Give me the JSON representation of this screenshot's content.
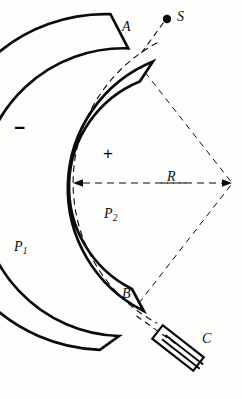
{
  "figure": {
    "background_color": "#fdfdfc",
    "ink_color": "#0b0b0b",
    "viewbox": "0 0 242 399",
    "center_of_curvature": {
      "x": 232,
      "y": 183
    },
    "deflection_angle_deg": 110
  },
  "labels": {
    "source": "S",
    "entrance_aperture": "A",
    "exit_aperture": "B",
    "detector": "C",
    "radius": "R",
    "outer_plate": "P",
    "outer_plate_subscript": "1",
    "inner_plate": "P",
    "inner_plate_subscript": "2",
    "outer_plate_polarity": "−",
    "inner_plate_polarity": "+"
  },
  "geometry": {
    "outer_plate_inner_radius": 137,
    "outer_plate_outer_radius": 160,
    "inner_plate_inner_radius": 114,
    "inner_plate_outer_radius": 137,
    "central_trajectory_radius": 159,
    "plate_start_angle_deg": 125,
    "plate_end_angle_deg": 235,
    "central_arc_start_angle_deg": 118,
    "central_arc_end_angle_deg": 242
  },
  "elements": {
    "source_dot": {
      "x": 167,
      "y": 19,
      "r": 4
    },
    "detector_slit": {
      "x": 178,
      "y": 348,
      "length": 52,
      "width": 15,
      "angle_deg": 38,
      "internal_lines": 2
    },
    "radius_arrow": {
      "from_x": 232,
      "from_y": 183,
      "to_x": 73,
      "to_y": 183,
      "double_headed": true
    }
  },
  "stroke_widths": {
    "plate": 2.6,
    "dashed": 1.1,
    "detector": 2.0
  }
}
